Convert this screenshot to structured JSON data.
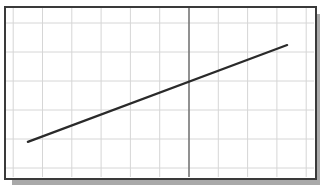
{
  "chart_data": {
    "type": "line",
    "title": "",
    "xlabel": "",
    "ylabel": "",
    "grid": true,
    "legend": null,
    "x_grid_spacing_units": 1,
    "y_grid_spacing_units": 1,
    "xlim": [
      -6,
      4.3
    ],
    "ylim": [
      -3.3,
      2.6
    ],
    "vertical_axis_at_x": 0,
    "series": [
      {
        "name": "line",
        "x": [
          -5.5,
          3.35
        ],
        "y": [
          -2.1,
          1.24
        ],
        "slope": 0.375,
        "intercept": 0
      }
    ]
  },
  "colors": {
    "frame": "#3a3a3a",
    "shadow": "#a9a9a9",
    "grid": "#d6d6d6",
    "axis": "#555555",
    "line": "#2a2a2a"
  }
}
